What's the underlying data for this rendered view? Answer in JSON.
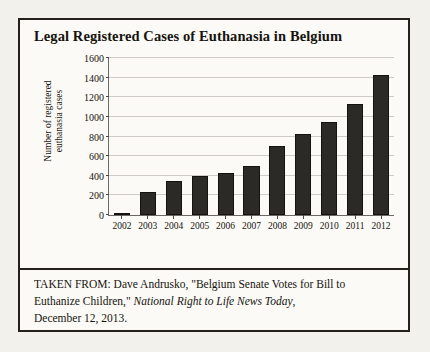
{
  "figure": {
    "title": "Legal Registered Cases of Euthanasia in Belgium",
    "caption": {
      "line1_prefix": "TAKEN FROM: Dave Andrusko, \"Belgium Senate Votes for Bill to",
      "line2_prefix": "Euthanize Children,\"",
      "line2_italic": "National Right to Life News Today",
      "line2_suffix": ",",
      "line3": "December 12, 2013."
    }
  },
  "chart_data": {
    "type": "bar",
    "title": "Legal Registered Cases of Euthanasia in Belgium",
    "xlabel": "",
    "ylabel": "Number of registered\neuthanasia cases",
    "categories": [
      "2002",
      "2003",
      "2004",
      "2005",
      "2006",
      "2007",
      "2008",
      "2009",
      "2010",
      "2011",
      "2012"
    ],
    "values": [
      24,
      235,
      349,
      393,
      429,
      495,
      704,
      822,
      953,
      1133,
      1432
    ],
    "ylim": [
      0,
      1600
    ],
    "ytick_values": [
      0,
      200,
      400,
      600,
      800,
      1000,
      1200,
      1400,
      1600
    ],
    "ytick_labels": [
      "0",
      "200",
      "400",
      "600",
      "800",
      "1000",
      "1200",
      "1400",
      "1600"
    ],
    "grid": true,
    "legend": false,
    "bar_color": "#2c2a26",
    "grid_color": "#cfccc5",
    "axis_color": "#6d6a64"
  }
}
